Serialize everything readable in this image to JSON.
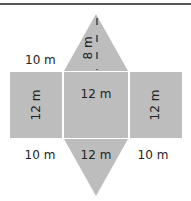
{
  "figure": {
    "colors": {
      "face": "#bdbdbd",
      "edge": "#ffffff",
      "rule": "#555555",
      "text": "#222222"
    },
    "labels": {
      "top_left": "10 m",
      "slant_height": "8 m",
      "left_rect_side": "12 m",
      "center_rect": "12 m",
      "right_rect_side": "12 m",
      "bottom_left": "10 m",
      "bottom_center": "12 m",
      "bottom_right": "10 m"
    }
  }
}
